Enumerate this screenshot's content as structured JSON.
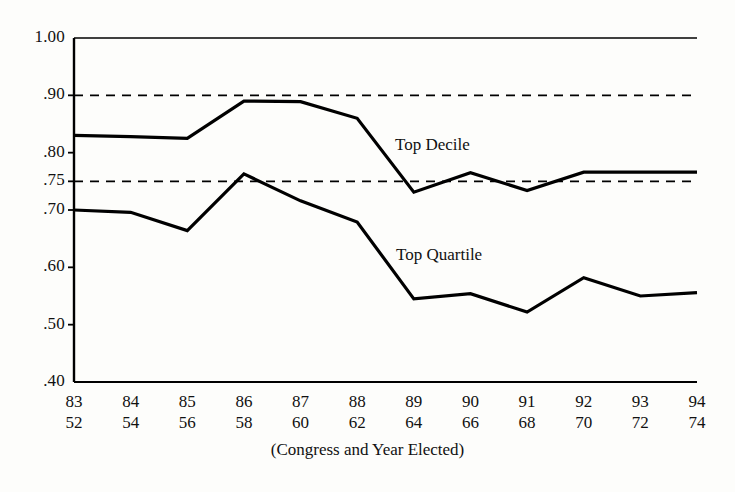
{
  "chart_data": {
    "type": "line",
    "title": "",
    "subtitle": "",
    "xlabel": "(Congress and Year Elected)",
    "ylabel": "",
    "ylim": [
      0.4,
      1.0
    ],
    "yticks": [
      "1.00",
      ".90",
      ".80",
      ".75",
      ".70",
      ".60",
      ".50",
      ".40"
    ],
    "ytick_values": [
      1.0,
      0.9,
      0.8,
      0.75,
      0.7,
      0.6,
      0.5,
      0.4
    ],
    "grid": false,
    "legend_position": "inline-annotation",
    "categories": [
      "83",
      "84",
      "85",
      "86",
      "87",
      "88",
      "89",
      "90",
      "91",
      "92",
      "93",
      "94"
    ],
    "x_secondary": [
      "52",
      "54",
      "56",
      "58",
      "60",
      "62",
      "64",
      "66",
      "68",
      "70",
      "72",
      "74"
    ],
    "reference_lines": [
      {
        "value": 0.9,
        "style": "dashed"
      },
      {
        "value": 0.75,
        "style": "dashed"
      }
    ],
    "series": [
      {
        "name": "Top Decile",
        "label_position": {
          "x": 395,
          "y": 135
        },
        "values": [
          0.83,
          0.828,
          0.825,
          0.89,
          0.889,
          0.86,
          0.731,
          0.765,
          0.734,
          0.766,
          0.766,
          0.766
        ]
      },
      {
        "name": "Top Quartile",
        "label_position": {
          "x": 396,
          "y": 245
        },
        "values": [
          0.7,
          0.696,
          0.664,
          0.763,
          0.716,
          0.679,
          0.545,
          0.554,
          0.522,
          0.582,
          0.55,
          0.556
        ]
      }
    ]
  },
  "axis_labels": {
    "xaxis_title": "(Congress and Year Elected)"
  },
  "colors": {
    "line": "#000000",
    "dashed": "#000000",
    "axis": "#000000",
    "background": "#fdfdfb",
    "text": "#111111"
  }
}
